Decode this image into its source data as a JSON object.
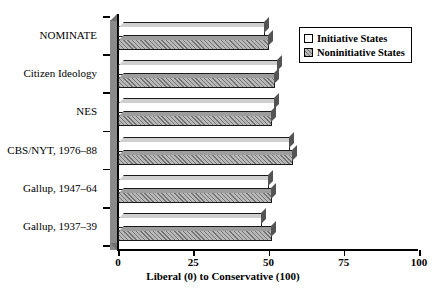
{
  "chart_data": {
    "type": "bar",
    "orientation": "horizontal",
    "title": "",
    "xlabel": "Liberal (0) to Conservative (100)",
    "ylabel": "",
    "xlim": [
      0,
      100
    ],
    "xticks": [
      0,
      25,
      50,
      75,
      100
    ],
    "xticklabels": [
      "0",
      "25",
      "50",
      "75",
      "100"
    ],
    "grid": false,
    "legend_position": "top-right",
    "categories": [
      "NOMINATE",
      "Citizen Ideology",
      "NES",
      "CBS/NYT, 1976–88",
      "Gallup, 1947–64",
      "Gallup, 1937–39"
    ],
    "series": [
      {
        "name": "Initiative States",
        "fill": "white",
        "color": "#ffffff",
        "values": [
          49,
          53,
          52,
          57,
          50,
          48
        ]
      },
      {
        "name": "Noninitiative States",
        "fill": "hatched-gray",
        "color": "#b9b9b9",
        "values": [
          50,
          52,
          51,
          58,
          51,
          51
        ]
      }
    ]
  },
  "legend": {
    "entries": [
      {
        "label": "Initiative States",
        "swatch": "white-square"
      },
      {
        "label": "Noninitiative States",
        "swatch": "hatched-gray-square"
      }
    ]
  }
}
